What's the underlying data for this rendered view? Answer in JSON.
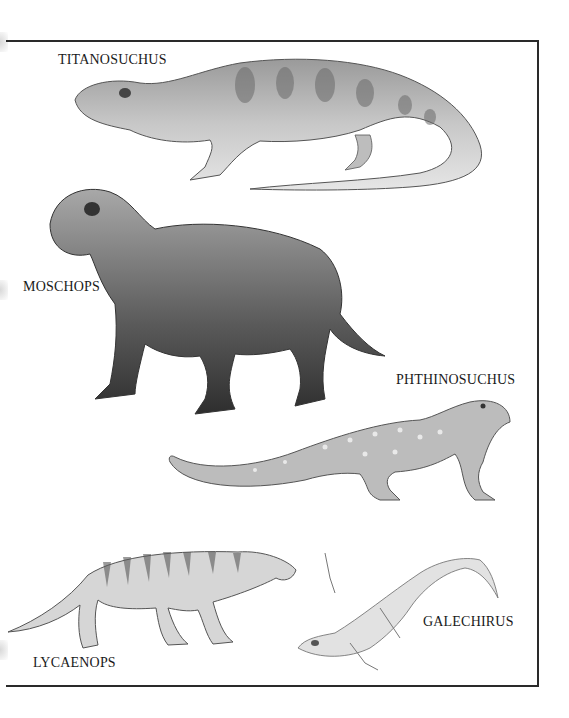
{
  "plate": {
    "labels": [
      {
        "id": "titanosuchus",
        "text": "TITANOSUCHUS"
      },
      {
        "id": "moschops",
        "text": "MOSCHOPS"
      },
      {
        "id": "phthinosuchus",
        "text": "PHTHINOSUCHUS"
      },
      {
        "id": "lycaenops",
        "text": "LYCAENOPS"
      },
      {
        "id": "galechirus",
        "text": "GALECHIRUS"
      }
    ]
  },
  "colors": {
    "ink": "#1a1a1a",
    "frame": "#2a2a2a",
    "background": "#ffffff"
  }
}
